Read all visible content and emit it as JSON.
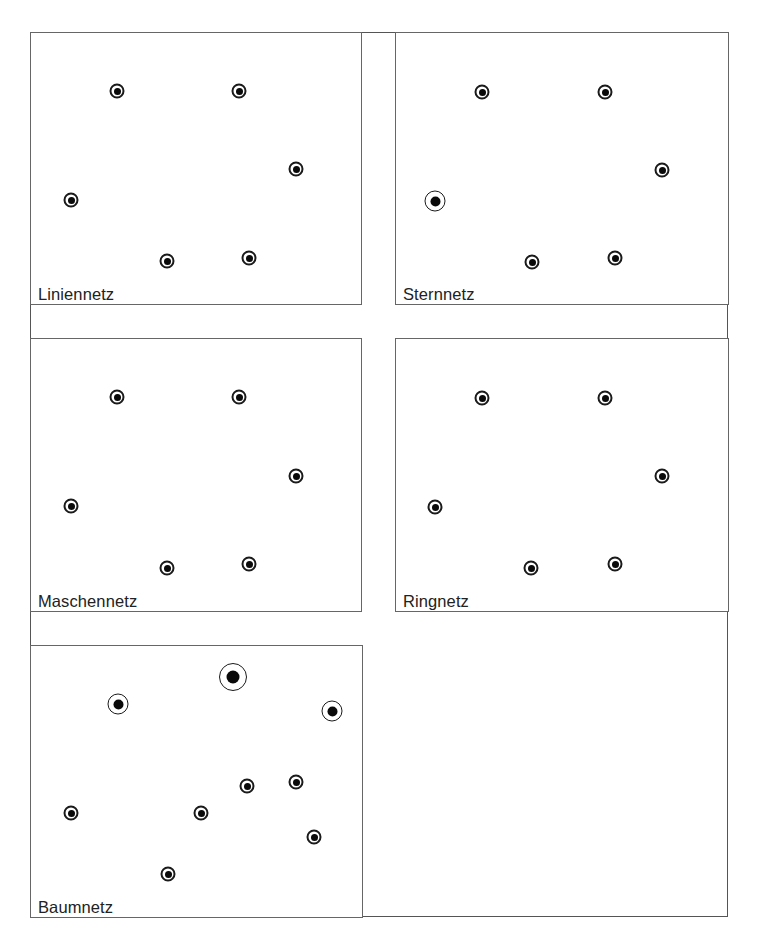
{
  "colors": {
    "line": "#555555",
    "node": "#0a0a0a",
    "background": "#ffffff"
  },
  "panels": [
    {
      "id": "liniennetz",
      "label": "Liniennetz",
      "box": {
        "left": 30,
        "top": 32,
        "width": 332,
        "height": 273
      },
      "nodes": [
        {
          "x": 86,
          "y": 58,
          "size": "small"
        },
        {
          "x": 208,
          "y": 58,
          "size": "small"
        },
        {
          "x": 265,
          "y": 136,
          "size": "small"
        },
        {
          "x": 40,
          "y": 167,
          "size": "small"
        },
        {
          "x": 136,
          "y": 228,
          "size": "small"
        },
        {
          "x": 218,
          "y": 225,
          "size": "small"
        }
      ]
    },
    {
      "id": "sternnetz",
      "label": "Sternnetz",
      "box": {
        "left": 395,
        "top": 32,
        "width": 334,
        "height": 273
      },
      "nodes": [
        {
          "x": 86,
          "y": 59,
          "size": "small"
        },
        {
          "x": 209,
          "y": 59,
          "size": "small"
        },
        {
          "x": 266,
          "y": 137,
          "size": "small"
        },
        {
          "x": 39,
          "y": 168,
          "size": "medium"
        },
        {
          "x": 136,
          "y": 229,
          "size": "small"
        },
        {
          "x": 219,
          "y": 225,
          "size": "small"
        }
      ]
    },
    {
      "id": "maschennetz",
      "label": "Maschennetz",
      "box": {
        "left": 30,
        "top": 338,
        "width": 332,
        "height": 274
      },
      "nodes": [
        {
          "x": 86,
          "y": 58,
          "size": "small"
        },
        {
          "x": 208,
          "y": 58,
          "size": "small"
        },
        {
          "x": 265,
          "y": 137,
          "size": "small"
        },
        {
          "x": 40,
          "y": 167,
          "size": "small"
        },
        {
          "x": 136,
          "y": 229,
          "size": "small"
        },
        {
          "x": 218,
          "y": 225,
          "size": "small"
        }
      ]
    },
    {
      "id": "ringnetz",
      "label": "Ringnetz",
      "box": {
        "left": 395,
        "top": 338,
        "width": 334,
        "height": 274
      },
      "nodes": [
        {
          "x": 86,
          "y": 59,
          "size": "small"
        },
        {
          "x": 209,
          "y": 59,
          "size": "small"
        },
        {
          "x": 266,
          "y": 137,
          "size": "small"
        },
        {
          "x": 39,
          "y": 168,
          "size": "small"
        },
        {
          "x": 135,
          "y": 229,
          "size": "small"
        },
        {
          "x": 219,
          "y": 225,
          "size": "small"
        }
      ]
    },
    {
      "id": "baumnetz",
      "label": "Baumnetz",
      "box": {
        "left": 30,
        "top": 645,
        "width": 333,
        "height": 273
      },
      "nodes": [
        {
          "x": 202,
          "y": 31,
          "size": "large"
        },
        {
          "x": 87,
          "y": 58,
          "size": "medium"
        },
        {
          "x": 301,
          "y": 65,
          "size": "medium"
        },
        {
          "x": 216,
          "y": 140,
          "size": "small"
        },
        {
          "x": 265,
          "y": 136,
          "size": "small"
        },
        {
          "x": 40,
          "y": 167,
          "size": "small"
        },
        {
          "x": 170,
          "y": 167,
          "size": "small"
        },
        {
          "x": 283,
          "y": 191,
          "size": "small"
        },
        {
          "x": 137,
          "y": 228,
          "size": "small"
        }
      ]
    }
  ]
}
